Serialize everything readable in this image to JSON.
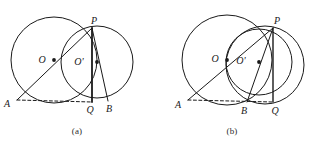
{
  "document": {
    "type": "geometry-figure-pair",
    "background_color": "#ffffff",
    "stroke_color": "#1a1a1a"
  },
  "figures": [
    {
      "id": "a",
      "caption": "(a)",
      "description": "Two intersecting circles meeting at P and Q, with chord AQ dashed and B outside segment AQ to the right of Q",
      "points": [
        {
          "name": "P",
          "label": "P",
          "x": 92,
          "y": 28,
          "label_dx": 2,
          "label_dy": -4,
          "dot": false
        },
        {
          "name": "O",
          "label": "O",
          "x": 54,
          "y": 60,
          "label_dx": -12,
          "label_dy": 3,
          "dot": true
        },
        {
          "name": "O-prime",
          "label": "O'",
          "x": 97,
          "y": 62,
          "label_dx": -18,
          "label_dy": 3,
          "dot": true
        },
        {
          "name": "A",
          "label": "A",
          "x": 17,
          "y": 100,
          "label_dx": -10,
          "label_dy": 7,
          "dot": false
        },
        {
          "name": "Q",
          "label": "Q",
          "x": 92,
          "y": 102,
          "label_dx": -2,
          "label_dy": 11,
          "dot": false
        },
        {
          "name": "B",
          "label": "B",
          "x": 108,
          "y": 101,
          "label_dx": 1,
          "label_dy": 11,
          "dot": false
        }
      ],
      "circles": [
        {
          "name": "large-circle",
          "cx": 54,
          "cy": 60,
          "r": 43
        },
        {
          "name": "small-circle",
          "cx": 97,
          "cy": 62,
          "r": 36
        }
      ],
      "segments": [
        {
          "name": "segment-A-P",
          "from": "A",
          "to": "P",
          "style": "solid",
          "width": 1
        },
        {
          "name": "segment-P-Q",
          "from": "P",
          "to": "Q",
          "style": "solid",
          "width": 1.8
        },
        {
          "name": "segment-P-B",
          "from": "P",
          "to": "B",
          "style": "solid",
          "width": 1
        },
        {
          "name": "segment-A-Q",
          "from": "A",
          "to": "Q",
          "style": "dashed",
          "width": 1
        }
      ]
    },
    {
      "id": "b",
      "caption": "(b)",
      "description": "Two intersecting circles meeting at P and Q, with chord AQ dashed and B between A and Q, plus a third arc bulging right of PQ",
      "points": [
        {
          "name": "P",
          "label": "P",
          "x": 118,
          "y": 28,
          "label_dx": 4,
          "label_dy": -4,
          "dot": false
        },
        {
          "name": "O",
          "label": "O",
          "x": 72,
          "y": 60,
          "label_dx": -12,
          "label_dy": 2,
          "dot": true
        },
        {
          "name": "O-prime",
          "label": "O'",
          "x": 104,
          "y": 62,
          "label_dx": -18,
          "label_dy": 2,
          "dot": true
        },
        {
          "name": "A",
          "label": "A",
          "x": 33,
          "y": 100,
          "label_dx": -10,
          "label_dy": 8,
          "dot": false
        },
        {
          "name": "B",
          "label": "B",
          "x": 92,
          "y": 102,
          "label_dx": -3,
          "label_dy": 12,
          "dot": false
        },
        {
          "name": "Q",
          "label": "Q",
          "x": 118,
          "y": 102,
          "label_dx": 2,
          "label_dy": 12,
          "dot": false
        }
      ],
      "circles": [
        {
          "name": "large-circle",
          "cx": 72,
          "cy": 60,
          "r": 45
        },
        {
          "name": "small-circle",
          "cx": 104,
          "cy": 62,
          "r": 33
        },
        {
          "name": "right-arc",
          "cx": 110,
          "cy": 65,
          "r": 39
        }
      ],
      "segments": [
        {
          "name": "segment-A-P",
          "from": "A",
          "to": "P",
          "style": "solid",
          "width": 1
        },
        {
          "name": "segment-P-Q",
          "from": "P",
          "to": "Q",
          "style": "solid",
          "width": 1.4
        },
        {
          "name": "segment-P-B",
          "from": "P",
          "to": "B",
          "style": "solid",
          "width": 1
        },
        {
          "name": "segment-A-Q",
          "from": "A",
          "to": "Q",
          "style": "dashed",
          "width": 1
        }
      ]
    }
  ]
}
